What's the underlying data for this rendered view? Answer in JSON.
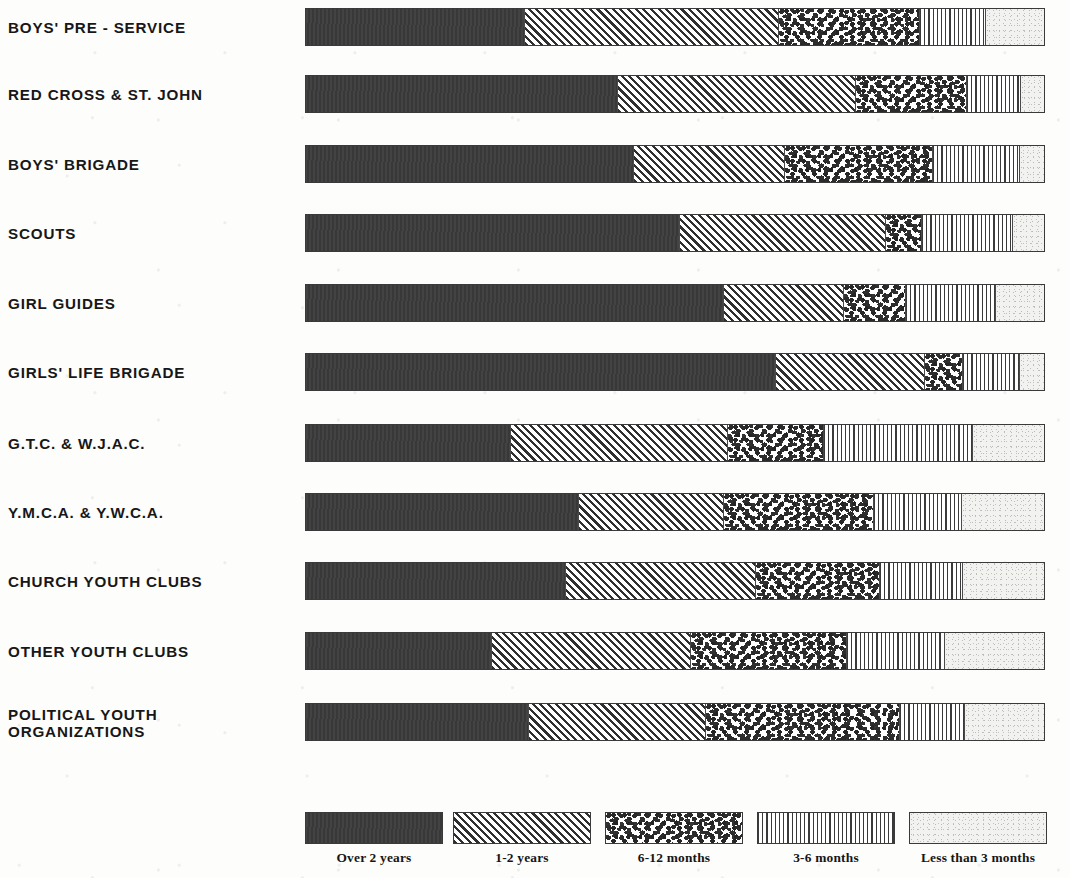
{
  "chart_data": {
    "type": "bar",
    "subtype": "horizontal-stacked-100-percent",
    "title": "",
    "xlabel": "",
    "ylabel": "",
    "xlim": [
      0,
      100
    ],
    "grid": false,
    "legend_position": "bottom",
    "units": "percent of members",
    "categories": [
      "BOYS' PRE - SERVICE",
      "RED CROSS & ST. JOHN",
      "BOYS' BRIGADE",
      "SCOUTS",
      "GIRL GUIDES",
      "GIRLS' LIFE BRIGADE",
      "G.T.C. & W.J.A.C.",
      "Y.M.C.A. & Y.W.C.A.",
      "CHURCH YOUTH CLUBS",
      "OTHER YOUTH CLUBS",
      "POLITICAL YOUTH ORGANIZATIONS"
    ],
    "series": [
      {
        "name": "Over 2 years",
        "pattern": "solid-dark",
        "color": "#3b3b3b",
        "values": [
          29.6,
          42.2,
          44.3,
          50.5,
          56.5,
          63.5,
          27.7,
          36.8,
          35.1,
          25.0,
          30.1
        ]
      },
      {
        "name": "1-2 years",
        "pattern": "diagonal-hatch",
        "color": "#2f2f2f",
        "values": [
          34.3,
          32.2,
          20.5,
          27.9,
          16.2,
          20.3,
          29.3,
          19.7,
          25.7,
          27.0,
          23.9
        ]
      },
      {
        "name": "6-12 months",
        "pattern": "coarse-speckle",
        "color": "#2b2b2b",
        "values": [
          19.2,
          15.1,
          20.0,
          5.0,
          8.4,
          5.1,
          13.0,
          20.3,
          16.9,
          21.2,
          26.4
        ]
      },
      {
        "name": "3-6 months",
        "pattern": "fine-vertical-lines",
        "color": "#3a3a3a",
        "values": [
          8.9,
          7.2,
          11.8,
          12.3,
          12.2,
          7.7,
          20.3,
          12.0,
          11.2,
          13.3,
          8.8
        ]
      },
      {
        "name": "Less than 3 months",
        "pattern": "light-stipple",
        "color": "#f2f2f0",
        "values": [
          8.0,
          3.3,
          3.4,
          4.3,
          6.7,
          3.4,
          9.7,
          11.2,
          11.1,
          13.5,
          10.8
        ]
      }
    ]
  },
  "rows": [
    {
      "label": "BOYS' PRE - SERVICE",
      "two_line": false,
      "values": [
        29.6,
        34.3,
        19.2,
        8.9,
        8.0
      ]
    },
    {
      "label": "RED CROSS & ST. JOHN",
      "two_line": false,
      "values": [
        42.2,
        32.2,
        15.1,
        7.2,
        3.3
      ]
    },
    {
      "label": "BOYS' BRIGADE",
      "two_line": false,
      "values": [
        44.3,
        20.5,
        20.0,
        11.8,
        3.4
      ]
    },
    {
      "label": "SCOUTS",
      "two_line": false,
      "values": [
        50.5,
        27.9,
        5.0,
        12.3,
        4.3
      ]
    },
    {
      "label": "GIRL GUIDES",
      "two_line": false,
      "values": [
        56.5,
        16.2,
        8.4,
        12.2,
        6.7
      ]
    },
    {
      "label": "GIRLS' LIFE BRIGADE",
      "two_line": false,
      "values": [
        63.5,
        20.3,
        5.1,
        7.7,
        3.4
      ]
    },
    {
      "label": "G.T.C. & W.J.A.C.",
      "two_line": false,
      "values": [
        27.7,
        29.3,
        13.0,
        20.3,
        9.7
      ]
    },
    {
      "label": "Y.M.C.A. & Y.W.C.A.",
      "two_line": false,
      "values": [
        36.8,
        19.7,
        20.3,
        12.0,
        11.2
      ]
    },
    {
      "label": "CHURCH YOUTH CLUBS",
      "two_line": false,
      "values": [
        35.1,
        25.7,
        16.9,
        11.2,
        11.1
      ]
    },
    {
      "label": "OTHER YOUTH CLUBS",
      "two_line": false,
      "values": [
        25.0,
        27.0,
        21.2,
        13.3,
        13.5
      ]
    },
    {
      "label": "POLITICAL YOUTH\nORGANIZATIONS",
      "two_line": true,
      "values": [
        30.1,
        23.9,
        26.4,
        8.8,
        10.8
      ]
    }
  ],
  "legend": {
    "items": [
      {
        "label": "Over 2 years",
        "pattern": "solid-dark"
      },
      {
        "label": "1-2 years",
        "pattern": "diagonal-hatch"
      },
      {
        "label": "6-12 months",
        "pattern": "coarse-speckle"
      },
      {
        "label": "3-6 months",
        "pattern": "fine-vertical-lines"
      },
      {
        "label": "Less than 3 months",
        "pattern": "light-stipple"
      }
    ]
  },
  "colors": {
    "over_2_years": "#3b3b3b",
    "one_to_two_years": "#2f2f2f",
    "six_to_twelve_months": "#2b2b2b",
    "three_to_six_months": "#3a3a3a",
    "less_than_three_months": "#f2f2f0",
    "page_background": "#fdfdfc",
    "text": "#171717"
  }
}
